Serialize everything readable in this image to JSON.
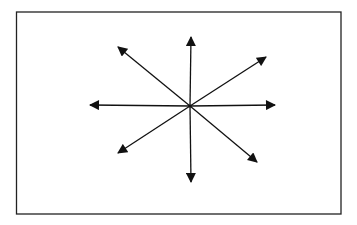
{
  "diagram": {
    "stroke_color": "#111111",
    "background": "#ffffff",
    "frame": {
      "x": 16.5,
      "y": 12,
      "width": 324.5,
      "height": 202
    },
    "center": {
      "x": 190,
      "y": 106
    },
    "arrows": [
      {
        "name": "up",
        "tip": [
          191,
          37
        ]
      },
      {
        "name": "up-right",
        "tip": [
          266,
          57
        ]
      },
      {
        "name": "right",
        "tip": [
          275,
          105
        ]
      },
      {
        "name": "down-right",
        "tip": [
          257,
          162
        ]
      },
      {
        "name": "down",
        "tip": [
          191,
          182
        ]
      },
      {
        "name": "down-left",
        "tip": [
          118,
          153
        ]
      },
      {
        "name": "left",
        "tip": [
          90,
          105
        ]
      },
      {
        "name": "up-left",
        "tip": [
          118,
          47
        ]
      }
    ]
  }
}
